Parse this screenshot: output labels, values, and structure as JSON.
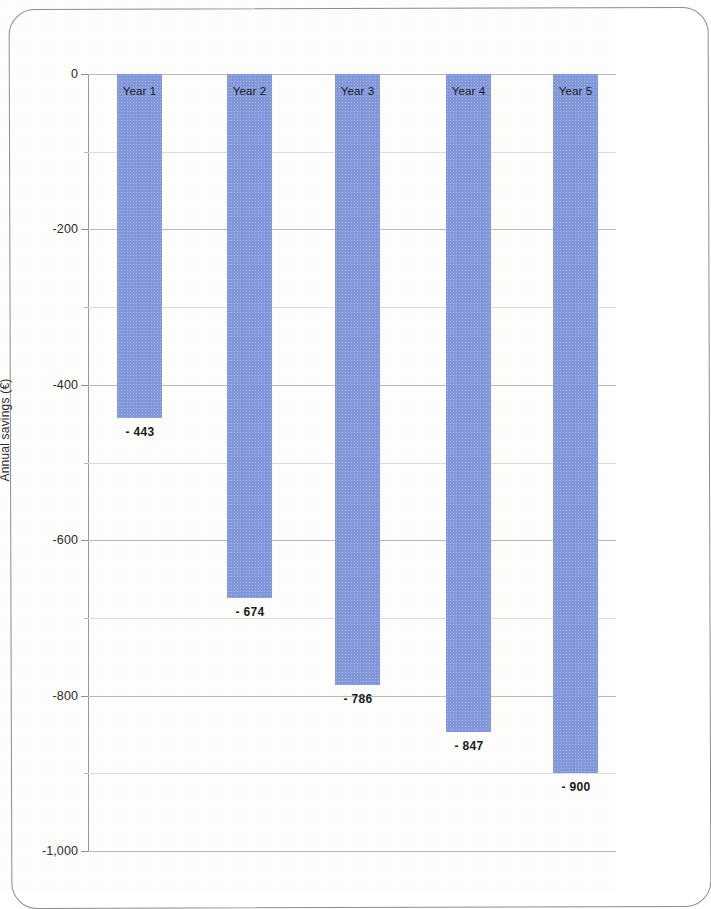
{
  "chart_data": {
    "type": "bar",
    "title": "",
    "xlabel": "",
    "ylabel": "Annual savings (€)",
    "categories": [
      "Year 1",
      "Year 2",
      "Year 3",
      "Year 4",
      "Year 5"
    ],
    "values": [
      -443,
      -674,
      -786,
      -847,
      -900
    ],
    "value_labels": [
      "- 443",
      "- 674",
      "- 786",
      "- 847",
      "- 900"
    ],
    "ylim": [
      -1000,
      0
    ],
    "ytick_labels": [
      "0",
      "-200",
      "-400",
      "-600",
      "-800",
      "-1,000"
    ],
    "ytick_values": [
      0,
      -200,
      -400,
      -600,
      -800,
      -1000
    ],
    "minor_ticks": [
      -100,
      -300,
      -500,
      -700,
      -900
    ],
    "grid": true,
    "legend": "none",
    "bar_color": "#8298da",
    "gridline_color": "#b9b9b9",
    "axis_color": "#9a9a9a",
    "text_color": "#2b2b2b"
  },
  "frame": {
    "border_color": "#8d8d8d"
  }
}
